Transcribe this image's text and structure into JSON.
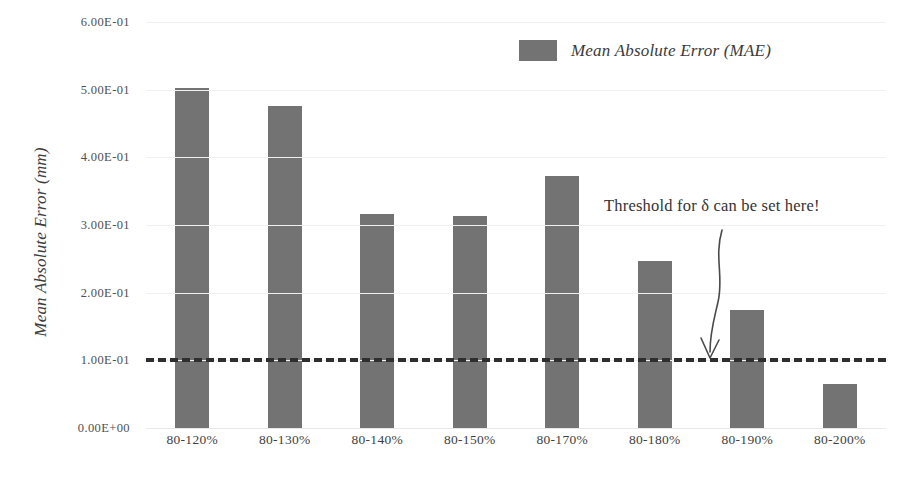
{
  "chart_data": {
    "type": "bar",
    "title": "",
    "xlabel": "",
    "ylabel": "Mean Absolute Error (mm)",
    "categories": [
      "80-120%",
      "80-130%",
      "80-140%",
      "80-150%",
      "80-170%",
      "80-180%",
      "80-190%",
      "80-200%"
    ],
    "values": [
      0.503,
      0.476,
      0.317,
      0.314,
      0.373,
      0.247,
      0.175,
      0.065
    ],
    "series": [
      {
        "name": "Mean Absolute Error (MAE)",
        "values": [
          0.503,
          0.476,
          0.317,
          0.314,
          0.373,
          0.247,
          0.175,
          0.065
        ]
      }
    ],
    "ylim": [
      0.0,
      0.6
    ],
    "ytick_values": [
      0.0,
      0.1,
      0.2,
      0.3,
      0.4,
      0.5,
      0.6
    ],
    "ytick_labels": [
      "0.00E+00",
      "1.00E-01",
      "2.00E-01",
      "3.00E-01",
      "4.00E-01",
      "5.00E-01",
      "6.00E-01"
    ],
    "grid": true,
    "legend_position": "top-right",
    "bar_color": "#737373",
    "threshold": {
      "value": 0.104,
      "style": "dashed",
      "color": "#2e2e2e"
    },
    "annotations": [
      {
        "text": "Threshold for δ can be set here!",
        "points_to": "threshold-line"
      }
    ]
  },
  "legend": {
    "entries": [
      {
        "label": "Mean Absolute Error (MAE)",
        "color": "#737373"
      }
    ]
  },
  "axis": {
    "y_title": "Mean Absolute Error (mm)"
  },
  "caption": {
    "text": ""
  }
}
